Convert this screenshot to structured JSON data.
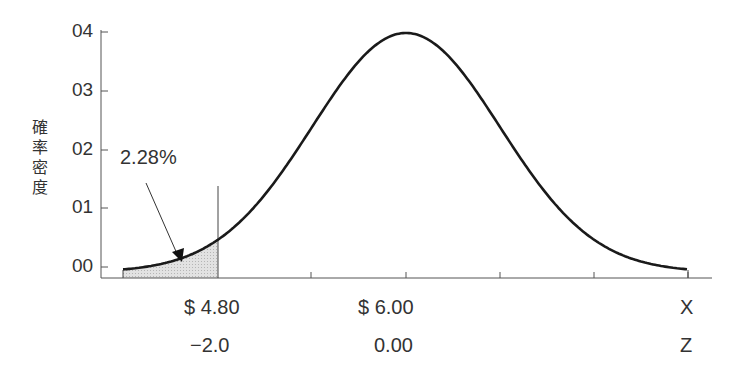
{
  "chart_data": {
    "type": "area",
    "title": "",
    "ylabel": "確率密度",
    "xlabel": "X",
    "y_ticks": [
      "04",
      "03",
      "02",
      "01",
      "00"
    ],
    "x_axis": {
      "rows": [
        {
          "name": "X",
          "labels": [
            {
              "at": 218,
              "text": "$4.80"
            },
            {
              "at": 406,
              "text": "$6.00"
            }
          ]
        },
        {
          "name": "Z",
          "labels": [
            {
              "at": 218,
              "text": "−2.0"
            },
            {
              "at": 406,
              "text": "0.00"
            }
          ]
        }
      ]
    },
    "distribution": {
      "kind": "normal",
      "mean_x": 6.0,
      "mean_z": 0.0,
      "shaded_below_z": -2.0
    },
    "annotation": {
      "text": "2.28%",
      "target": "shaded left tail area"
    },
    "grid": false,
    "legend": null
  },
  "labels": {
    "ylabel_chars": [
      "確",
      "率",
      "密",
      "度"
    ],
    "annotation": "2.28%",
    "x_row_name": "X",
    "z_row_name": "Z",
    "x_val_1": "$ 4.80",
    "x_val_2": "$ 6.00",
    "z_val_1": "−2.0",
    "z_val_2": "0.00",
    "yt0": "04",
    "yt1": "03",
    "yt2": "02",
    "yt3": "01",
    "yt4": "00"
  }
}
